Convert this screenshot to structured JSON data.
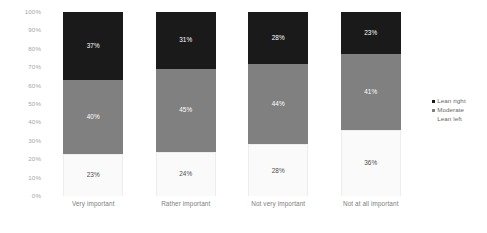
{
  "chart_data": {
    "type": "bar",
    "subtype": "stacked-100-percent",
    "title": "",
    "subtitle": "",
    "xlabel": "",
    "ylabel": "",
    "ylim": [
      0,
      100
    ],
    "grid": false,
    "legend_position": "right",
    "categories": [
      "Very important",
      "Rather important",
      "Not very important",
      "Not at all important"
    ],
    "ytick_labels": [
      "100%",
      "90%",
      "80%",
      "70%",
      "60%",
      "50%",
      "40%",
      "30%",
      "20%",
      "10%",
      "0%"
    ],
    "ytick_values": [
      100,
      90,
      80,
      70,
      60,
      50,
      40,
      30,
      20,
      10,
      0
    ],
    "series": [
      {
        "name": "Lean right",
        "color": "#1a1a1a",
        "values": [
          37,
          31,
          28,
          23
        ],
        "labels": [
          "37%",
          "31%",
          "28%",
          "23%"
        ]
      },
      {
        "name": "Moderate",
        "color": "#808080",
        "values": [
          40,
          45,
          44,
          41
        ],
        "labels": [
          "40%",
          "45%",
          "44%",
          "41%"
        ]
      },
      {
        "name": "Lean left",
        "color": "#fafafa",
        "values": [
          23,
          24,
          28,
          36
        ],
        "labels": [
          "23%",
          "24%",
          "28%",
          "36%"
        ]
      }
    ]
  },
  "legend": {
    "items": [
      {
        "label": "Lean right",
        "color": "#1a1a1a",
        "swatch_visible": true
      },
      {
        "label": "Moderate",
        "color": "#808080",
        "swatch_visible": true
      },
      {
        "label": "Lean left",
        "color": "#ffffff",
        "swatch_visible": false
      }
    ]
  },
  "colors": {
    "lean_right": "#1a1a1a",
    "moderate": "#808080",
    "lean_left": "#fafafa",
    "axis_text": "#a6a6a6",
    "category_text": "#808080",
    "legend_text": "#666666",
    "background": "#ffffff"
  }
}
